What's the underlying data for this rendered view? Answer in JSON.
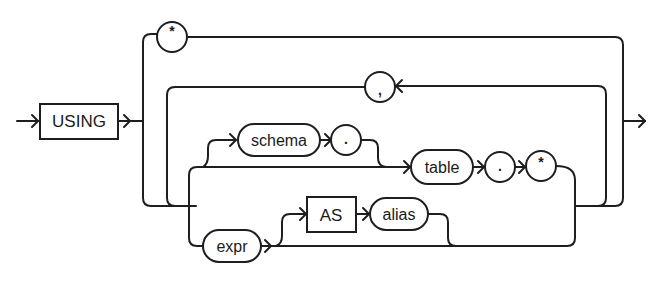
{
  "diagram": {
    "type": "railroad-syntax-diagram",
    "keywords": {
      "using": "USING",
      "as": "AS"
    },
    "nonterminals": {
      "schema": "schema",
      "table": "table",
      "expr": "expr",
      "alias": "alias"
    },
    "symbols": {
      "star_top": "*",
      "comma": ",",
      "dot_schema": ".",
      "dot_table": ".",
      "star_table": "*"
    },
    "colors": {
      "stroke": "#1e1e1e",
      "background": "#ffffff"
    }
  }
}
